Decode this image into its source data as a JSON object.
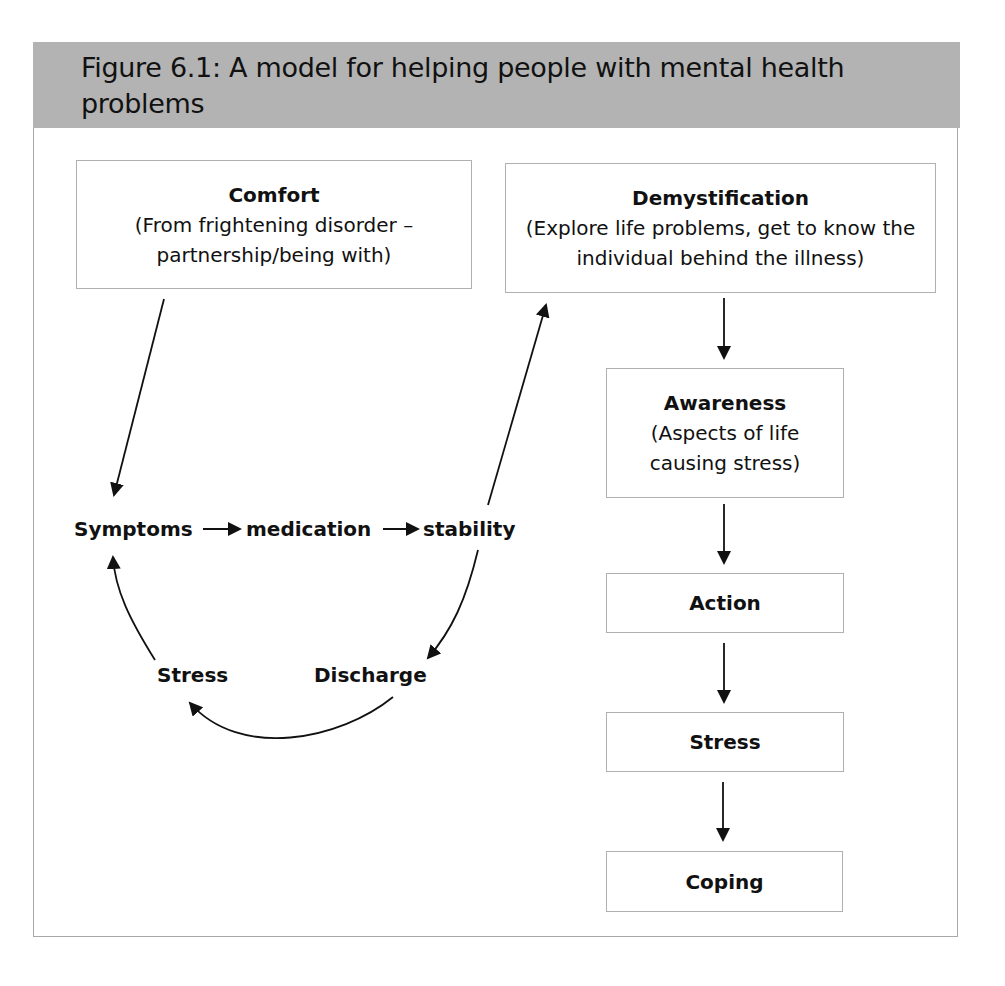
{
  "figure": {
    "title": "Figure 6.1: A model for helping people with mental health problems"
  },
  "boxes": {
    "comfort": {
      "heading": "Comfort",
      "sub": "(From frightening disorder – partnership/being with)"
    },
    "demystification": {
      "heading": "Demystification",
      "sub": "(Explore life problems, get to know the individual behind the illness)"
    },
    "awareness": {
      "heading": "Awareness",
      "sub": "(Aspects of life causing stress)"
    },
    "action": {
      "heading": "Action"
    },
    "stress": {
      "heading": "Stress"
    },
    "coping": {
      "heading": "Coping"
    }
  },
  "cycle": {
    "symptoms": "Symptoms",
    "medication": "medication",
    "stability": "stability",
    "stress": "Stress",
    "discharge": "Discharge"
  },
  "edges": [
    {
      "from": "Comfort",
      "to": "Symptoms"
    },
    {
      "from": "Symptoms",
      "to": "medication"
    },
    {
      "from": "medication",
      "to": "stability"
    },
    {
      "from": "stability",
      "to": "Demystification"
    },
    {
      "from": "stability",
      "to": "Discharge"
    },
    {
      "from": "Discharge",
      "to": "Stress"
    },
    {
      "from": "Stress",
      "to": "Symptoms"
    },
    {
      "from": "Demystification",
      "to": "Awareness"
    },
    {
      "from": "Awareness",
      "to": "Action"
    },
    {
      "from": "Action",
      "to": "Stress (box)"
    },
    {
      "from": "Stress (box)",
      "to": "Coping"
    }
  ],
  "colors": {
    "header_bg": "#b3b3b3",
    "box_border": "#b0b0b0",
    "text": "#111111"
  }
}
